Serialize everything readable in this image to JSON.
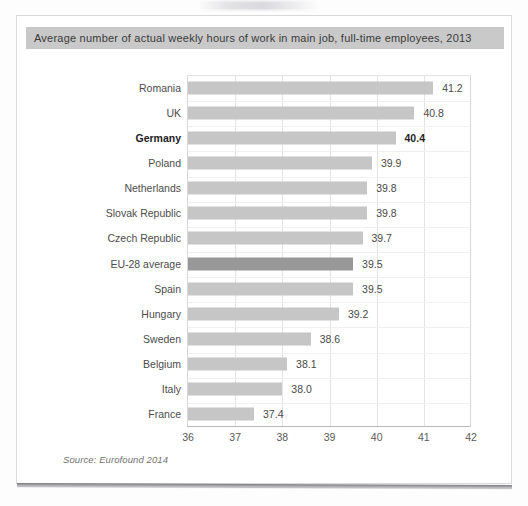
{
  "page": {
    "background_color": "#fdfdfd",
    "card_background": "#ffffff",
    "card_border_color": "#d9d9d9"
  },
  "title_banner": {
    "text": "Average number of actual weekly hours of work in main job, full-time employees, 2013",
    "background_color": "#c9c9c9",
    "text_color": "#3a3a3a"
  },
  "source": {
    "text": "Source: Eurofound 2014"
  },
  "colors": {
    "bar_default": "#c6c6c6",
    "bar_highlight": "#989898",
    "gridline": "#e4e4e4",
    "axis": "#b9b9b9"
  },
  "chart_data": {
    "type": "bar",
    "orientation": "horizontal",
    "title": "Average number of actual weekly hours of work in main job, full-time employees, 2013",
    "xlabel": "",
    "ylabel": "",
    "xlim": [
      36,
      42
    ],
    "xticks": [
      36,
      37,
      38,
      39,
      40,
      41,
      42
    ],
    "xtick_labels": [
      "36",
      "37",
      "38",
      "39",
      "40",
      "41",
      "42"
    ],
    "grid": true,
    "legend": false,
    "value_labels": true,
    "categories": [
      "Romania",
      "UK",
      "Germany",
      "Poland",
      "Netherlands",
      "Slovak Republic",
      "Czech Republic",
      "EU-28 average",
      "Spain",
      "Hungary",
      "Sweden",
      "Belgium",
      "Italy",
      "France"
    ],
    "values": [
      41.2,
      40.8,
      40.4,
      39.9,
      39.8,
      39.8,
      39.7,
      39.5,
      39.5,
      39.2,
      38.6,
      38.1,
      38.0,
      37.4
    ],
    "value_labels_text": [
      "41.2",
      "40.8",
      "40.4",
      "39.9",
      "39.8",
      "39.8",
      "39.7",
      "39.5",
      "39.5",
      "39.2",
      "38.6",
      "38.1",
      "38.0",
      "37.4"
    ],
    "bold_categories": [
      "Germany"
    ],
    "highlight_categories": [
      "EU-28 average"
    ],
    "units": "hours per week"
  }
}
